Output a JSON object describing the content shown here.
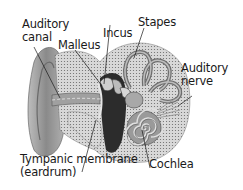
{
  "diagram": {
    "labels": [
      {
        "id": "auditory-canal",
        "line1": "Auditory",
        "line2": "canal"
      },
      {
        "id": "malleus",
        "line1": "Malleus"
      },
      {
        "id": "incus",
        "line1": "Incus"
      },
      {
        "id": "stapes",
        "line1": "Stapes"
      },
      {
        "id": "auditory-nerve",
        "line1": "Auditory",
        "line2": "nerve"
      },
      {
        "id": "tympanic-membrane",
        "line1": "Tympanic membrane",
        "line2": "(eardrum)"
      },
      {
        "id": "cochlea",
        "line1": "Cochlea"
      }
    ]
  }
}
